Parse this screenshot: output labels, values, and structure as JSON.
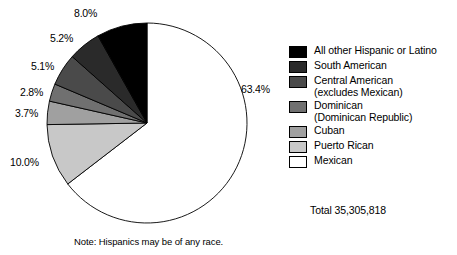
{
  "chart_data": {
    "type": "pie",
    "title": "",
    "subtitle": "",
    "xlabel": "",
    "ylabel": "",
    "legend_position": "right",
    "grid": false,
    "total_label": "Total 35,305,818",
    "total_value": 35305818,
    "note": "Note: Hispanics may be of any race.",
    "start_angle_deg": 0,
    "direction": "clockwise",
    "categories": [
      "Mexican",
      "Puerto Rican",
      "Cuban",
      "Dominican (Dominican Republic)",
      "Central American (excludes Mexican)",
      "South American",
      "All other Hispanic or Latino"
    ],
    "values": [
      63.4,
      10.0,
      3.7,
      2.8,
      5.1,
      5.2,
      8.0
    ],
    "value_labels": [
      "63.4%",
      "10.0%",
      "3.7%",
      "2.8%",
      "5.1%",
      "5.2%",
      "8.0%"
    ],
    "slice_colors": [
      "#ffffff",
      "#c8c8c8",
      "#a0a0a0",
      "#707070",
      "#4a4a4a",
      "#2a2a2a",
      "#000000"
    ],
    "slice_stroke": "#000000"
  },
  "callouts": [
    {
      "name": "pct-all-other",
      "text": "8.0%",
      "left": 74,
      "top": 8
    },
    {
      "name": "pct-south-american",
      "text": "5.2%",
      "left": 50,
      "top": 33
    },
    {
      "name": "pct-central-american",
      "text": "5.1%",
      "left": 31,
      "top": 61
    },
    {
      "name": "pct-dominican",
      "text": "2.8%",
      "left": 20,
      "top": 87
    },
    {
      "name": "pct-cuban",
      "text": "3.7%",
      "left": 15,
      "top": 108
    },
    {
      "name": "pct-puerto-rican",
      "text": "10.0%",
      "left": 10,
      "top": 157
    },
    {
      "name": "pct-mexican",
      "text": "63.4%",
      "left": 241,
      "top": 84
    }
  ],
  "legend": {
    "items": [
      {
        "label": "All other Hispanic or Latino",
        "sub": "",
        "color": "#000000"
      },
      {
        "label": "South American",
        "sub": "",
        "color": "#2a2a2a"
      },
      {
        "label": "Central American",
        "sub": "(excludes Mexican)",
        "color": "#4a4a4a"
      },
      {
        "label": "Dominican",
        "sub": "(Dominican Republic)",
        "color": "#707070"
      },
      {
        "label": "Cuban",
        "sub": "",
        "color": "#a0a0a0"
      },
      {
        "label": "Puerto Rican",
        "sub": "",
        "color": "#c8c8c8"
      },
      {
        "label": "Mexican",
        "sub": "",
        "color": "#ffffff"
      }
    ]
  }
}
